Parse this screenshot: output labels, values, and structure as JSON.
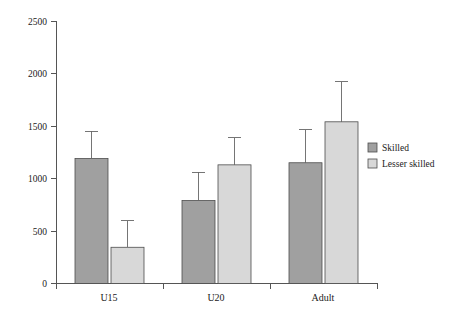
{
  "chart_data": {
    "type": "bar",
    "title": "",
    "subtitle": "",
    "xlabel": "",
    "ylabel": "",
    "categories": [
      "U15",
      "U20",
      "Adult"
    ],
    "series": [
      {
        "name": "Skilled",
        "color": "#a0a0a0",
        "values": [
          1190,
          790,
          1150
        ],
        "error_upper": [
          1450,
          1060,
          1465
        ]
      },
      {
        "name": "Lesser skilled",
        "color": "#d8d8d8",
        "values": [
          345,
          1130,
          1540
        ],
        "error_upper": [
          600,
          1390,
          1920
        ]
      }
    ],
    "ylim": [
      0,
      2500
    ],
    "yticks": [
      0,
      500,
      1000,
      1500,
      2000,
      2500
    ],
    "ytick_labels": [
      "0",
      "500",
      "1000",
      "1500",
      "2000",
      "2500"
    ],
    "xtick_labels": [
      "U15",
      "U20",
      "Adult"
    ],
    "grid": false,
    "legend_position": "right",
    "legend_entries": [
      "Skilled",
      "Lesser skilled"
    ],
    "error_bar_style": "upper-whisker-with-cap",
    "background_color": "#ffffff",
    "axis_color": "#555555"
  },
  "axis": {
    "y_labels": [
      "2500",
      "2000",
      "1500",
      "1000",
      "500",
      "0"
    ],
    "x_labels": [
      "U15",
      "U20",
      "Adult"
    ]
  },
  "legend": {
    "items": [
      {
        "label": "Skilled",
        "color": "#a0a0a0"
      },
      {
        "label": "Lesser skilled",
        "color": "#d8d8d8"
      }
    ]
  }
}
